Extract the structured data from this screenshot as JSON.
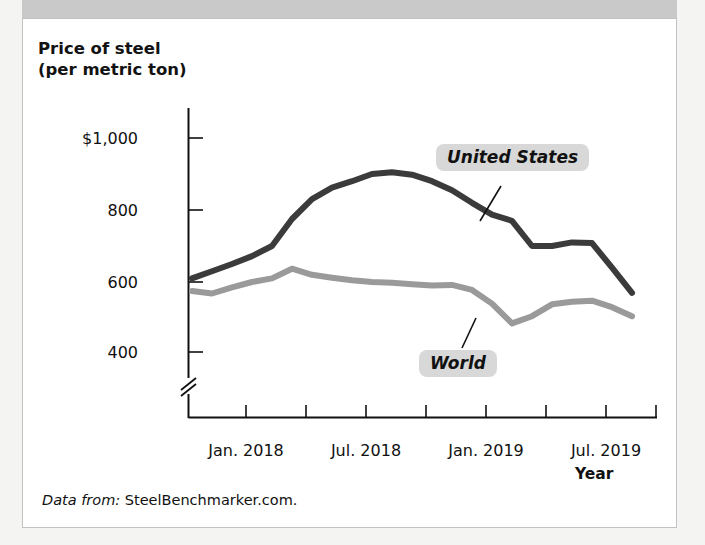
{
  "figure": {
    "title": "and the World",
    "source_lead": "Data from:",
    "source_value": "SteelBenchmarker.com.",
    "frame_color": "#c2c2c2",
    "title_bar_color": "#c9c9c9"
  },
  "axes": {
    "y_title_line1": "Price of steel",
    "y_title_line2": "(per metric ton)",
    "x_title": "Year",
    "y_ticks": [
      "$1,000",
      "800",
      "600",
      "400"
    ],
    "x_ticks": [
      "Jan. 2018",
      "Jul. 2018",
      "Jan. 2019",
      "Jul. 2019"
    ],
    "has_axis_break": true
  },
  "callouts": {
    "united_states": "United States",
    "world": "World"
  },
  "chart_data": {
    "type": "line",
    "xlabel": "Year",
    "ylabel": "Price of steel (per metric ton)",
    "ylim": [
      380,
      1060
    ],
    "ytick_values": [
      400,
      600,
      800,
      1000
    ],
    "xtick_labels": [
      "Jan. 2018",
      "Jul. 2018",
      "Jan. 2019",
      "Jul. 2019"
    ],
    "grid": false,
    "legend": "inline callout labels",
    "axis_break_y_below": 400,
    "x": [
      "Oct. 2017",
      "Nov. 2017",
      "Dec. 2017",
      "Jan. 2018",
      "Feb. 2018",
      "Mar. 2018",
      "Apr. 2018",
      "May 2018",
      "Jun. 2018",
      "Jul. 2018",
      "Aug. 2018",
      "Sep. 2018",
      "Oct. 2018",
      "Nov. 2018",
      "Dec. 2018",
      "Jan. 2019",
      "Feb. 2019",
      "Mar. 2019",
      "Apr. 2019",
      "May 2019",
      "Jun. 2019",
      "Jul. 2019",
      "Aug. 2019"
    ],
    "series": [
      {
        "name": "United States",
        "color": "#3b3b3b",
        "values": [
          610,
          630,
          650,
          672,
          700,
          775,
          830,
          862,
          880,
          900,
          905,
          898,
          880,
          855,
          820,
          787,
          770,
          700,
          700,
          710,
          708,
          640,
          570
        ]
      },
      {
        "name": "World",
        "color": "#9a9a9a",
        "values": [
          575,
          568,
          585,
          600,
          610,
          637,
          620,
          612,
          605,
          600,
          598,
          594,
          590,
          592,
          578,
          540,
          485,
          505,
          538,
          545,
          548,
          530,
          505
        ]
      }
    ]
  },
  "bleed_text": [
    "of how many people",
    "who like steel",
    "can show us the price",
    "changes in the market",
    "and the prices of",
    "steel in the world"
  ]
}
